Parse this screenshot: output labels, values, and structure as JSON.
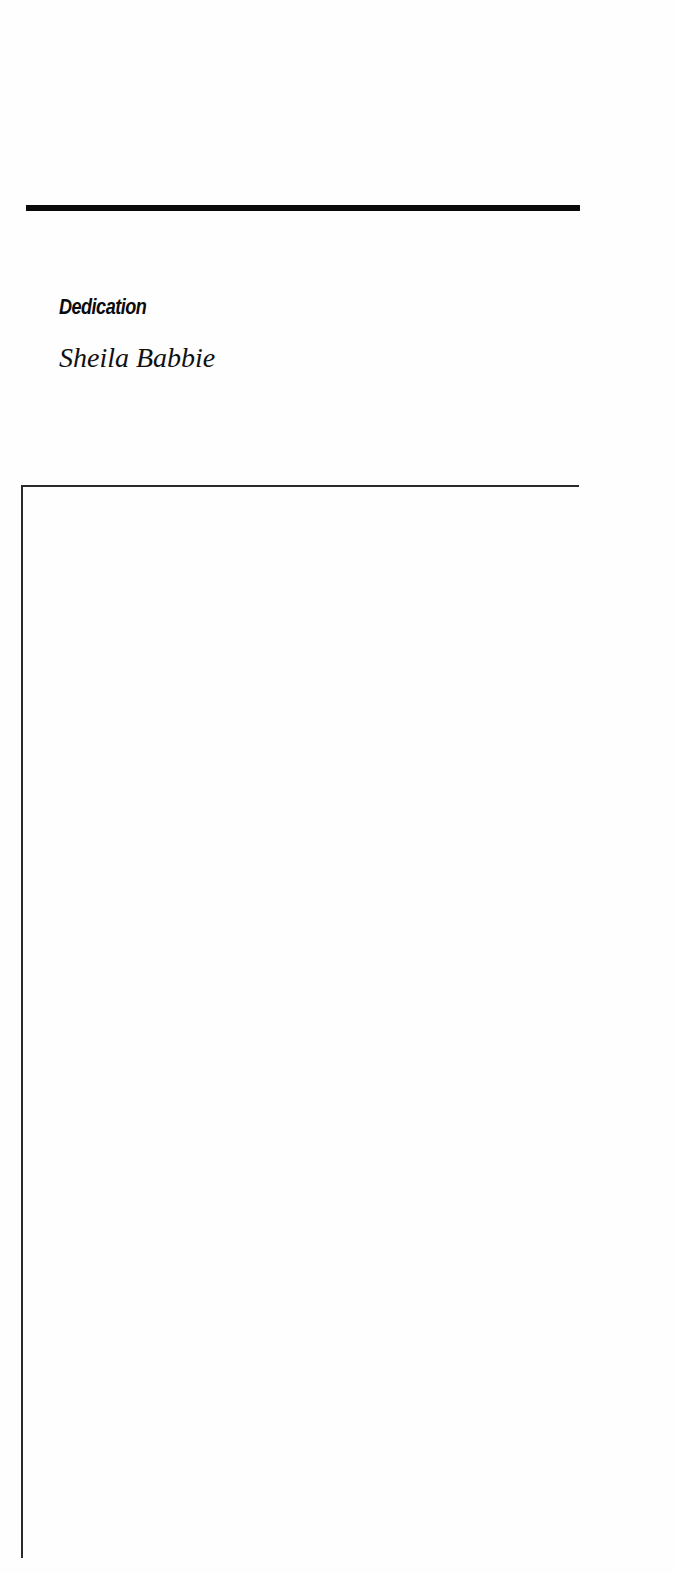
{
  "page": {
    "heading": "Dedication",
    "dedicatee": "Sheila Babbie"
  }
}
